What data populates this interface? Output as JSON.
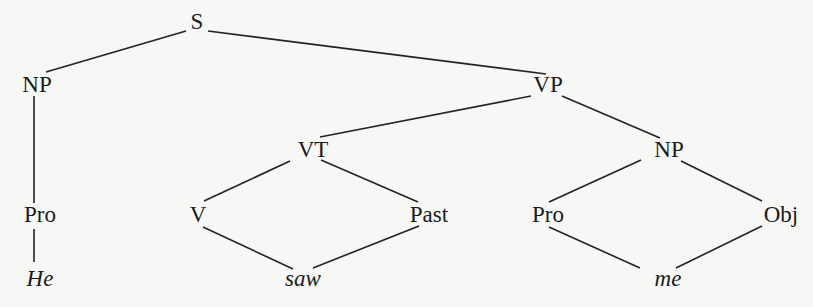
{
  "diagram": {
    "type": "syntax-tree",
    "nodes": [
      {
        "id": "S",
        "label": "S",
        "x": 197,
        "y": 22,
        "leaf": false
      },
      {
        "id": "NP1",
        "label": "NP",
        "x": 37,
        "y": 85,
        "leaf": false
      },
      {
        "id": "VP",
        "label": "VP",
        "x": 548,
        "y": 85,
        "leaf": false
      },
      {
        "id": "VT",
        "label": "VT",
        "x": 313,
        "y": 150,
        "leaf": false
      },
      {
        "id": "NP2",
        "label": "NP",
        "x": 669,
        "y": 150,
        "leaf": false
      },
      {
        "id": "Pro1",
        "label": "Pro",
        "x": 40,
        "y": 215,
        "leaf": false
      },
      {
        "id": "V",
        "label": "V",
        "x": 198,
        "y": 215,
        "leaf": false
      },
      {
        "id": "Past",
        "label": "Past",
        "x": 429,
        "y": 215,
        "leaf": false
      },
      {
        "id": "Pro2",
        "label": "Pro",
        "x": 548,
        "y": 215,
        "leaf": false
      },
      {
        "id": "Obj",
        "label": "Obj",
        "x": 781,
        "y": 215,
        "leaf": false
      },
      {
        "id": "He",
        "label": "He",
        "x": 40,
        "y": 279,
        "leaf": true
      },
      {
        "id": "saw",
        "label": "saw",
        "x": 303,
        "y": 279,
        "leaf": true
      },
      {
        "id": "me",
        "label": "me",
        "x": 668,
        "y": 279,
        "leaf": true
      }
    ],
    "edges": [
      {
        "from": "S",
        "to": "NP1",
        "x1": 186,
        "y1": 31,
        "x2": 46,
        "y2": 72
      },
      {
        "from": "S",
        "to": "VP",
        "x1": 208,
        "y1": 31,
        "x2": 546,
        "y2": 74
      },
      {
        "from": "NP1",
        "to": "Pro1",
        "x1": 34,
        "y1": 96,
        "x2": 34,
        "y2": 203
      },
      {
        "from": "VP",
        "to": "VT",
        "x1": 531,
        "y1": 96,
        "x2": 320,
        "y2": 137
      },
      {
        "from": "VP",
        "to": "NP2",
        "x1": 562,
        "y1": 96,
        "x2": 660,
        "y2": 138
      },
      {
        "from": "VT",
        "to": "V",
        "x1": 290,
        "y1": 161,
        "x2": 204,
        "y2": 201
      },
      {
        "from": "VT",
        "to": "Past",
        "x1": 321,
        "y1": 160,
        "x2": 418,
        "y2": 202
      },
      {
        "from": "NP2",
        "to": "Pro2",
        "x1": 641,
        "y1": 160,
        "x2": 549,
        "y2": 202
      },
      {
        "from": "NP2",
        "to": "Obj",
        "x1": 681,
        "y1": 161,
        "x2": 762,
        "y2": 201
      },
      {
        "from": "Pro1",
        "to": "He",
        "x1": 34,
        "y1": 229,
        "x2": 34,
        "y2": 262
      },
      {
        "from": "V",
        "to": "saw",
        "x1": 203,
        "y1": 227,
        "x2": 293,
        "y2": 269
      },
      {
        "from": "Past",
        "to": "saw",
        "x1": 419,
        "y1": 226,
        "x2": 313,
        "y2": 268
      },
      {
        "from": "Pro2",
        "to": "me",
        "x1": 549,
        "y1": 227,
        "x2": 640,
        "y2": 268
      },
      {
        "from": "Obj",
        "to": "me",
        "x1": 762,
        "y1": 226,
        "x2": 676,
        "y2": 268
      }
    ]
  }
}
